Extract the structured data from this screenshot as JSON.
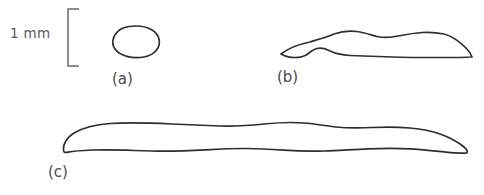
{
  "figure": {
    "caption_present": false,
    "background_color": "#ffffff",
    "outline_color": "#2e2e2e",
    "scalebar_color": "#6b6b6b",
    "label_color": "#4a4a4a"
  },
  "scale_bar": {
    "label": "1 mm",
    "orientation": "vertical",
    "style": "bracket",
    "label_x": 10,
    "label_y": 38,
    "bracket_top_y": 9,
    "bracket_bottom_y": 66,
    "bracket_x": 68,
    "bracket_arm_length": 11
  },
  "panels": [
    {
      "id": "a",
      "label": "(a)",
      "label_x": 112,
      "label_y": 84,
      "description": "small rounded ovoid outline",
      "bbox": {
        "x": 113,
        "y": 26,
        "width": 47,
        "height": 33
      },
      "path": "M 136 26 C 148 26 157 31 159 39 C 161 47 155 55 144 57 C 132 59 120 56 115 49 C 110 42 114 32 123 28 C 127 26.5 131 26 136 26 Z"
    },
    {
      "id": "b",
      "label": "(b)",
      "label_x": 277,
      "label_y": 82,
      "description": "elongated wavy blob with dorsal humps, tapering at both tips",
      "bbox": {
        "x": 280,
        "y": 30,
        "width": 192,
        "height": 29
      },
      "path": "M 281 54 C 290 47 300 44 310 42 C 320 39 327 37 334 34 C 341 31.5 349 30.5 357 31.5 C 365 32.5 371 35 377 36.5 C 384 38 391 37.5 398 36 C 406 34.5 414 33 422 32.5 C 430 32 437 32.5 444 34 C 452 36 460 42 466 48 C 469 51 471 54 472 57 C 464 57.5 452 57.5 440 57.5 C 424 57.5 408 57.5 392 57 C 376 56.5 362 56 350 55.5 C 341 55 334 53 329 50.5 C 325 48.5 321 47.5 317 48.5 C 313 49.5 310 52 307 54.5 C 304 56.5 300 57.5 295 57.5 C 290 57.5 285 56.5 281 54 Z"
    },
    {
      "id": "c",
      "label": "(c)",
      "label_x": 48,
      "label_y": 177,
      "description": "very long narrow slightly wavy band, blunt hooked left tip and tapered right tip",
      "bbox": {
        "x": 62,
        "y": 122,
        "width": 406,
        "height": 32
      },
      "path": "M 64 152 C 62 146 66 138 74 133 C 84 127 96 124.5 110 123.5 C 128 122.3 150 123 172 124 C 190 124.8 206 125.5 220 126 C 236 126.6 250 125.5 264 124 C 278 122.6 292 122 304 123 C 316 124 326 126 336 127 C 348 128.2 360 128 372 127.5 C 386 127 398 127 410 128 C 422 129 432 131 440 134 C 450 137.5 458 142 464 147 C 467 149.5 468 151.5 467 152.8 C 462 153.5 454 153 446 152.2 C 434 151 422 149.5 410 148.8 C 396 148 382 148.2 368 148.8 C 352 149.5 338 150.5 324 151 C 310 151.5 296 151 284 150.2 C 272 149.4 260 148.6 248 148.5 C 234 148.4 220 149 206 149.8 C 192 150.6 178 151.2 164 151.2 C 150 151.2 138 150.6 126 150.2 C 114 149.8 102 149.6 92 150 C 82 150.4 74 151 68 152.2 C 66 152.6 65 152.5 64 152 Z"
    }
  ]
}
